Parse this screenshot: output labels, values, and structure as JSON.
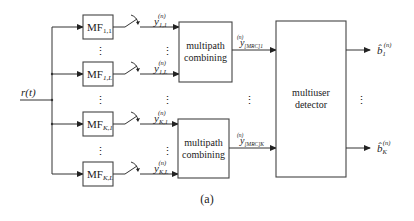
{
  "figure": {
    "caption": "(a)",
    "input": {
      "label": "r(t)"
    },
    "matched_filters": [
      {
        "id": "mf-1-1",
        "base": "MF",
        "sub": "1,1"
      },
      {
        "id": "mf-1-L",
        "base": "MF",
        "sub": "1,L"
      },
      {
        "id": "mf-K-1",
        "base": "MF",
        "sub": "K,1"
      },
      {
        "id": "mf-K-L",
        "base": "MF",
        "sub": "K,L"
      }
    ],
    "sampled_outputs": [
      {
        "base": "y",
        "sup": "(n)",
        "sub": "1,1"
      },
      {
        "base": "y",
        "sup": "(n)",
        "sub": "1,L"
      },
      {
        "base": "y",
        "sup": "(n)",
        "sub": "K,1"
      },
      {
        "base": "y",
        "sup": "(n)",
        "sub": "K,L"
      }
    ],
    "combiners": [
      {
        "line1": "multipath",
        "line2": "combining"
      },
      {
        "line1": "multipath",
        "line2": "combining"
      }
    ],
    "combiner_outputs": [
      {
        "base": "y",
        "sup": "(n)",
        "sub": "[MRC]1"
      },
      {
        "base": "y",
        "sup": "(n)",
        "sub": "[MRC]K"
      }
    ],
    "detector": {
      "line1": "multiuser",
      "line2": "detector"
    },
    "decisions": [
      {
        "base": "b̂",
        "sup": "(n)",
        "sub": "1"
      },
      {
        "base": "b̂",
        "sup": "(n)",
        "sub": "K"
      }
    ],
    "ellipsis": "⋮"
  }
}
